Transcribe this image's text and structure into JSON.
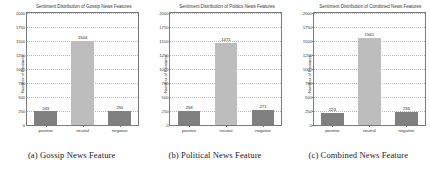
{
  "figure": {
    "panels": [
      {
        "caption": "(a) Gossip News Feature",
        "chart_data": {
          "type": "bar",
          "title": "Sentiment Distribution of Gossip News Features",
          "xlabel": "",
          "ylabel": "Number of Features",
          "categories": [
            "positive",
            "neutral",
            "negative"
          ],
          "values": [
            243,
            1504,
            255
          ],
          "ylim": [
            0,
            2000
          ],
          "yticks": [
            0,
            250,
            500,
            750,
            1000,
            1250,
            1500,
            1750,
            2000
          ],
          "ytick_labels": [
            "0",
            "250",
            "500",
            "750",
            "1000",
            "1250",
            "1500",
            "1750",
            "2000"
          ],
          "bar_colors": [
            "#808080",
            "#bdbdbd",
            "#808080"
          ],
          "grid": true,
          "legend": "none",
          "data_labels": [
            "243",
            "1504",
            "255"
          ]
        }
      },
      {
        "caption": "(b) Political News Feature",
        "chart_data": {
          "type": "bar",
          "title": "Sentiment Distribution of Politics News Features",
          "xlabel": "",
          "ylabel": "Number of Features",
          "categories": [
            "positive",
            "neutral",
            "negative"
          ],
          "values": [
            258,
            1471,
            271
          ],
          "ylim": [
            0,
            2000
          ],
          "yticks": [
            0,
            250,
            500,
            750,
            1000,
            1250,
            1500,
            1750,
            2000
          ],
          "ytick_labels": [
            "0",
            "250",
            "500",
            "750",
            "1000",
            "1250",
            "1500",
            "1750",
            "2000"
          ],
          "bar_colors": [
            "#808080",
            "#bdbdbd",
            "#808080"
          ],
          "grid": true,
          "legend": "none",
          "data_labels": [
            "258",
            "1471",
            "271"
          ]
        }
      },
      {
        "caption": "(c) Combined News Feature",
        "chart_data": {
          "type": "bar",
          "title": "Sentiment Distribution of Combined News Features",
          "xlabel": "",
          "ylabel": "Number of Features",
          "categories": [
            "positive",
            "neutral",
            "negative"
          ],
          "values": [
            223,
            1561,
            236
          ],
          "ylim": [
            0,
            2000
          ],
          "yticks": [
            0,
            250,
            500,
            750,
            1000,
            1250,
            1500,
            1750,
            2000
          ],
          "ytick_labels": [
            "0",
            "250",
            "500",
            "750",
            "1000",
            "1250",
            "1500",
            "1750",
            "2000"
          ],
          "bar_colors": [
            "#808080",
            "#bdbdbd",
            "#808080"
          ],
          "grid": true,
          "legend": "none",
          "data_labels": [
            "223",
            "1561",
            "236"
          ]
        }
      }
    ]
  }
}
